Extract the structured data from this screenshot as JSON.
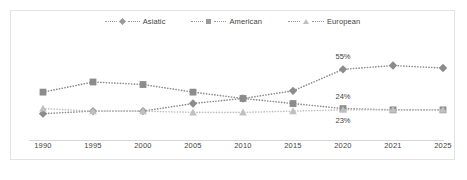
{
  "chart_data": {
    "type": "line",
    "title": "",
    "subtitle": "",
    "xlabel": "",
    "ylabel": "",
    "categories": [
      "1990",
      "1995",
      "2000",
      "2005",
      "2010",
      "2015",
      "2020",
      "2021",
      "2025"
    ],
    "ylim": [
      0,
      60
    ],
    "grid": false,
    "legend_position": "top-center",
    "series": [
      {
        "name": "Asiatic",
        "marker": "diamond",
        "color": "#8c8c8c",
        "linestyle": "dotted",
        "values": [
          20,
          22,
          22,
          28,
          32,
          38,
          55,
          58,
          56
        ]
      },
      {
        "name": "American",
        "marker": "square",
        "color": "#8c8c8c",
        "linestyle": "dotted",
        "values": [
          37,
          45,
          43,
          37,
          32,
          28,
          24,
          23,
          23
        ]
      },
      {
        "name": "European",
        "marker": "triangle",
        "color": "#c0c0c0",
        "linestyle": "dotted",
        "values": [
          24,
          22,
          22,
          21,
          21,
          22,
          23,
          23,
          23
        ]
      }
    ],
    "data_labels": [
      {
        "text": "55%",
        "series": "Asiatic",
        "category": "2020",
        "position": "above"
      },
      {
        "text": "24%",
        "series": "American",
        "category": "2020",
        "position": "above"
      },
      {
        "text": "23%",
        "series": "European",
        "category": "2020",
        "position": "below"
      }
    ]
  },
  "legend": {
    "items": [
      {
        "label": "Asiatic",
        "marker": "diamond-marker-icon"
      },
      {
        "label": "American",
        "marker": "square-marker-icon"
      },
      {
        "label": "European",
        "marker": "triangle-marker-icon"
      }
    ]
  },
  "axis": {
    "x_ticks": [
      "1990",
      "1995",
      "2000",
      "2005",
      "2010",
      "2015",
      "2020",
      "2021",
      "2025"
    ]
  },
  "colors": {
    "series_dark": "#8c8c8c",
    "series_light": "#c0c0c0",
    "text": "#3f3f3f",
    "border": "#e3e3e3",
    "axis": "#d6d6d6"
  }
}
